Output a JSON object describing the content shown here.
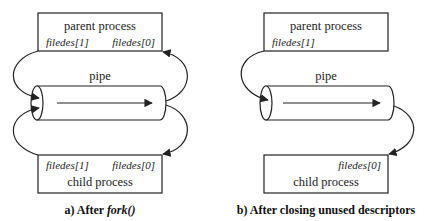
{
  "diagram_a": {
    "parent": {
      "title": "parent process",
      "fd_write": "filedes[1]",
      "fd_read": "filedes[0]"
    },
    "pipe_label": "pipe",
    "child": {
      "title": "child process",
      "fd_write": "filedes[1]",
      "fd_read": "filedes[0]"
    },
    "caption_prefix": "a) After ",
    "caption_call": "fork()"
  },
  "diagram_b": {
    "parent": {
      "title": "parent process",
      "fd_write": "filedes[1]"
    },
    "pipe_label": "pipe",
    "child": {
      "title": "child process",
      "fd_read": "filedes[0]"
    },
    "caption": "b) After closing unused descriptors"
  },
  "colors": {
    "stroke": "#222222",
    "background": "#ffffff"
  }
}
